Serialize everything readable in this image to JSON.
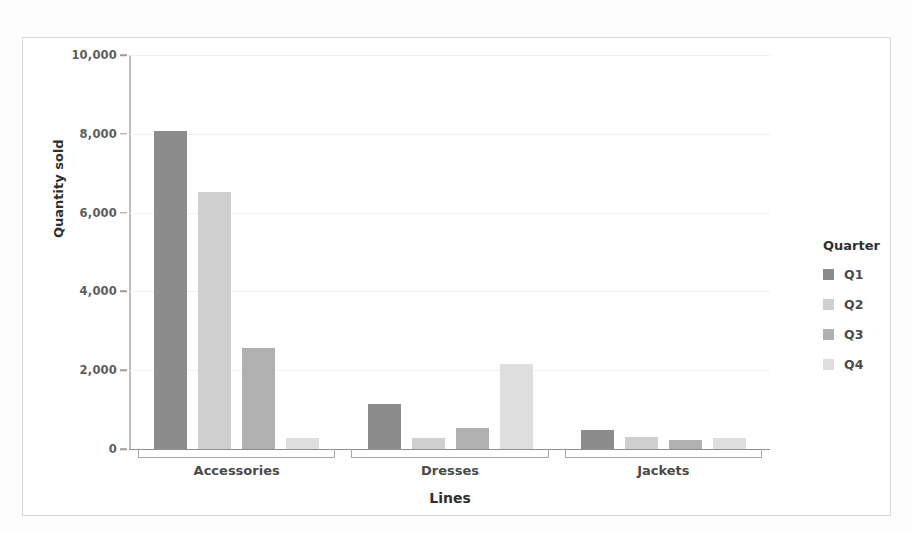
{
  "chart_data": {
    "type": "bar",
    "title": "",
    "xlabel": "Lines",
    "ylabel": "Quantity sold",
    "categories": [
      "Accessories",
      "Dresses",
      "Jackets"
    ],
    "series": [
      {
        "name": "Q1",
        "values": [
          8070,
          1150,
          480
        ],
        "color": "#8c8c8c"
      },
      {
        "name": "Q2",
        "values": [
          6520,
          280,
          300
        ],
        "color": "#cfcfcf"
      },
      {
        "name": "Q3",
        "values": [
          2570,
          540,
          230
        ],
        "color": "#b0b0b0"
      },
      {
        "name": "Q4",
        "values": [
          280,
          2160,
          280
        ],
        "color": "#dedede"
      }
    ],
    "ylim": [
      0,
      10000
    ],
    "ytick_values": [
      0,
      2000,
      4000,
      6000,
      8000,
      10000
    ],
    "ytick_labels": [
      "0",
      "2,000",
      "4,000",
      "6,000",
      "8,000",
      "10,000"
    ],
    "grid": true,
    "legend_position": "right",
    "legend_title": "Quarter"
  },
  "legend": {
    "title": "Quarter",
    "items": [
      {
        "label": "Q1",
        "color": "#8c8c8c"
      },
      {
        "label": "Q2",
        "color": "#cfcfcf"
      },
      {
        "label": "Q3",
        "color": "#b0b0b0"
      },
      {
        "label": "Q4",
        "color": "#dedede"
      }
    ]
  },
  "axes": {
    "x_title": "Lines",
    "y_title": "Quantity sold"
  },
  "colors": {
    "frame_border": "#d8d8d8",
    "gridline": "#f0f0f0",
    "axis": "#8e8e8e",
    "tick_text": "#5d5d5d",
    "title_text": "#2f2f2f",
    "background": "#ffffff"
  }
}
